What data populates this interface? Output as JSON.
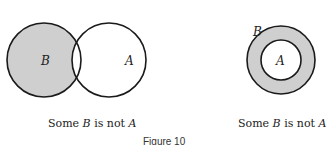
{
  "diagrams": [
    {
      "type": "venn-overlap",
      "circles": [
        {
          "label": "B",
          "cx": 44,
          "cy": 60,
          "r": 37,
          "shaded_part": "B minus A"
        },
        {
          "label": "A",
          "cx": 109,
          "cy": 60,
          "r": 37
        }
      ],
      "caption": {
        "pre": "Some ",
        "var1": "B",
        "mid": " is not ",
        "var2": "A"
      }
    },
    {
      "type": "annulus",
      "circles": [
        {
          "label": "B",
          "cx": 281,
          "cy": 60,
          "r": 34
        },
        {
          "label": "A",
          "cx": 281,
          "cy": 60,
          "r": 20
        }
      ],
      "caption": {
        "pre": "Some ",
        "var1": "B",
        "mid": " is not ",
        "var2": "A"
      }
    }
  ],
  "figure_label": "Figure 10",
  "colors": {
    "shade": "#cfcfcf",
    "stroke": "#1a1a1a"
  }
}
